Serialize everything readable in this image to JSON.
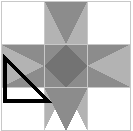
{
  "figure": {
    "kind": "quilt-block-diagram",
    "width": 133,
    "height": 131,
    "grid_rows": 3,
    "grid_cols": 3,
    "background_color": "#ffffff"
  },
  "palette": {
    "white": "#ffffff",
    "light_gray": "#b3b3b3",
    "medium_gray": "#8c8c8c",
    "dark_gray": "#737373",
    "grid_line": "#c8c8c8",
    "outline_black": "#000000"
  },
  "geometry": {
    "left": 1,
    "top": 1,
    "size": 130,
    "cell": 43.3,
    "col_x": [
      1,
      44.3,
      87.6,
      130.9
    ],
    "row_y": [
      1,
      44.3,
      87.6,
      130.9
    ]
  },
  "cells": [
    {
      "name": "corner-top-left",
      "row": 0,
      "col": 0,
      "type": "plain-square",
      "fill": "#ffffff"
    },
    {
      "name": "point-top-center",
      "row": 0,
      "col": 1,
      "type": "hourglass-star-point",
      "fill_a": "#b3b3b3",
      "fill_b": "#8c8c8c"
    },
    {
      "name": "corner-top-right",
      "row": 0,
      "col": 2,
      "type": "plain-square",
      "fill": "#ffffff"
    },
    {
      "name": "point-middle-left",
      "row": 1,
      "col": 0,
      "type": "hourglass-star-point",
      "fill_a": "#b3b3b3",
      "fill_b": "#8c8c8c"
    },
    {
      "name": "center-diamond",
      "row": 1,
      "col": 1,
      "type": "square-on-point",
      "fill": "#737373",
      "corner_fill": "#8c8c8c"
    },
    {
      "name": "point-middle-right",
      "row": 1,
      "col": 2,
      "type": "hourglass-star-point",
      "fill_a": "#b3b3b3",
      "fill_b": "#8c8c8c"
    },
    {
      "name": "corner-bottom-left",
      "row": 2,
      "col": 0,
      "type": "plain-square",
      "fill": "#ffffff"
    },
    {
      "name": "point-bottom-center",
      "row": 2,
      "col": 1,
      "type": "hourglass-star-point",
      "fill_a": "#b3b3b3",
      "fill_b": "#8c8c8c"
    },
    {
      "name": "corner-bottom-right",
      "row": 2,
      "col": 2,
      "type": "plain-square",
      "fill": "#ffffff"
    }
  ],
  "annotation": {
    "name": "highlighted-right-triangle",
    "shape": "right-triangle",
    "stroke": "#000000",
    "stroke_width": 4,
    "fill": "none",
    "points": "5,58 5,101 48,101",
    "right_angle_corner": "bottom-left",
    "label": ""
  },
  "alt_text": "Ohio Star quilt block on a three by three grid with white corner squares, gray star point triangles, a dark gray center square set on point, and one unit triangle outlined in black on the left middle patch."
}
